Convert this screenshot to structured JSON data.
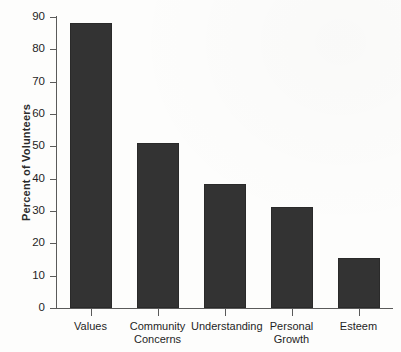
{
  "chart_data": {
    "type": "bar",
    "title": "",
    "xlabel": "",
    "ylabel": "Percent of Volunteers",
    "categories": [
      "Values",
      "Community\nConcerns",
      "Understanding",
      "Personal\nGrowth",
      "Esteem"
    ],
    "values": [
      88,
      51,
      38.5,
      31.2,
      15.5
    ],
    "ylim": [
      0,
      90
    ],
    "ytick_labels": [
      "0",
      "10",
      "20",
      "30",
      "40",
      "50",
      "60",
      "70",
      "80",
      "90"
    ],
    "ytick_values": [
      0,
      10,
      20,
      30,
      40,
      50,
      60,
      70,
      80,
      90
    ],
    "grid": false,
    "legend": false,
    "bar_color": "#333333",
    "axis_color": "#5a5a5a",
    "background_color": "#fdfdfc"
  },
  "axes": {
    "y_title": "Percent of Volunteers"
  }
}
